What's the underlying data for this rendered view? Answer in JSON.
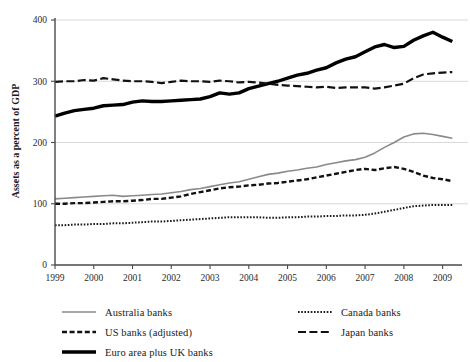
{
  "chart_data": {
    "type": "line",
    "title": "",
    "xlabel": "",
    "ylabel": "Assets as a percent of GDP",
    "xlim": [
      1999,
      2009.5
    ],
    "ylim": [
      0,
      400
    ],
    "yticks": [
      0,
      100,
      200,
      300,
      400
    ],
    "xticks": [
      1999,
      2000,
      2001,
      2002,
      2003,
      2004,
      2005,
      2006,
      2007,
      2008,
      2009
    ],
    "grid": "horizontal",
    "legend_position": "below-plot-two-columns",
    "x": [
      1999.0,
      1999.25,
      1999.5,
      1999.75,
      2000.0,
      2000.25,
      2000.5,
      2000.75,
      2001.0,
      2001.25,
      2001.5,
      2001.75,
      2002.0,
      2002.25,
      2002.5,
      2002.75,
      2003.0,
      2003.25,
      2003.5,
      2003.75,
      2004.0,
      2004.25,
      2004.5,
      2004.75,
      2005.0,
      2005.25,
      2005.5,
      2005.75,
      2006.0,
      2006.25,
      2006.5,
      2006.75,
      2007.0,
      2007.25,
      2007.5,
      2007.75,
      2008.0,
      2008.25,
      2008.5,
      2008.75,
      2009.0,
      2009.25
    ],
    "series": [
      {
        "name": "Australia banks",
        "color": "#8a8a8a",
        "style": "solid-thin",
        "values": [
          108,
          109,
          110,
          111,
          112,
          113,
          114,
          112,
          113,
          114,
          115,
          116,
          118,
          120,
          123,
          125,
          128,
          131,
          134,
          136,
          140,
          144,
          148,
          150,
          153,
          155,
          158,
          160,
          164,
          167,
          170,
          172,
          176,
          183,
          192,
          200,
          209,
          214,
          215,
          213,
          210,
          207
        ]
      },
      {
        "name": "US banks (adjusted)",
        "color": "#111111",
        "style": "dashed",
        "values": [
          100,
          100,
          101,
          101,
          102,
          103,
          104,
          104,
          105,
          106,
          108,
          108,
          110,
          112,
          116,
          119,
          122,
          125,
          127,
          128,
          130,
          131,
          133,
          134,
          136,
          138,
          140,
          143,
          146,
          149,
          152,
          155,
          157,
          155,
          158,
          160,
          157,
          152,
          146,
          142,
          140,
          137
        ]
      },
      {
        "name": "Euro area plus UK banks",
        "color": "#000000",
        "style": "solid-thick",
        "values": [
          243,
          248,
          252,
          254,
          256,
          260,
          261,
          262,
          266,
          268,
          267,
          267,
          268,
          269,
          270,
          271,
          275,
          281,
          279,
          281,
          288,
          292,
          296,
          300,
          305,
          310,
          313,
          318,
          322,
          330,
          336,
          340,
          348,
          356,
          360,
          355,
          357,
          367,
          374,
          380,
          372,
          365
        ]
      },
      {
        "name": "Canada banks",
        "color": "#1a1a1a",
        "style": "dotted",
        "values": [
          65,
          65,
          66,
          66,
          67,
          67,
          68,
          68,
          69,
          70,
          71,
          71,
          72,
          73,
          74,
          75,
          76,
          77,
          78,
          78,
          78,
          78,
          77,
          77,
          78,
          78,
          79,
          79,
          80,
          80,
          81,
          81,
          82,
          84,
          87,
          90,
          93,
          96,
          97,
          98,
          98,
          98
        ]
      },
      {
        "name": "Japan banks",
        "color": "#111111",
        "style": "long-dash",
        "values": [
          299,
          300,
          300,
          302,
          301,
          305,
          303,
          301,
          300,
          300,
          299,
          297,
          299,
          301,
          300,
          300,
          299,
          301,
          300,
          298,
          299,
          298,
          296,
          294,
          293,
          292,
          291,
          290,
          291,
          289,
          290,
          290,
          290,
          288,
          290,
          293,
          296,
          305,
          311,
          313,
          314,
          315
        ]
      }
    ]
  },
  "axis": {
    "ylabel": "Assets as a percent of GDP",
    "ytick_labels": [
      "0",
      "100",
      "200",
      "300",
      "400"
    ],
    "xtick_labels": [
      "1999",
      "2000",
      "2001",
      "2002",
      "2003",
      "2004",
      "2005",
      "2006",
      "2007",
      "2008",
      "2009"
    ]
  },
  "legend": {
    "left_column": [
      {
        "label": "Australia banks",
        "style": "solid-thin",
        "color": "#8a8a8a"
      },
      {
        "label": "US banks (adjusted)",
        "style": "dashed",
        "color": "#111111"
      },
      {
        "label": "Euro area plus UK banks",
        "style": "solid-thick",
        "color": "#000000"
      }
    ],
    "right_column": [
      {
        "label": "Canada banks",
        "style": "dotted",
        "color": "#1a1a1a"
      },
      {
        "label": "Japan banks",
        "style": "long-dash",
        "color": "#111111"
      }
    ]
  }
}
